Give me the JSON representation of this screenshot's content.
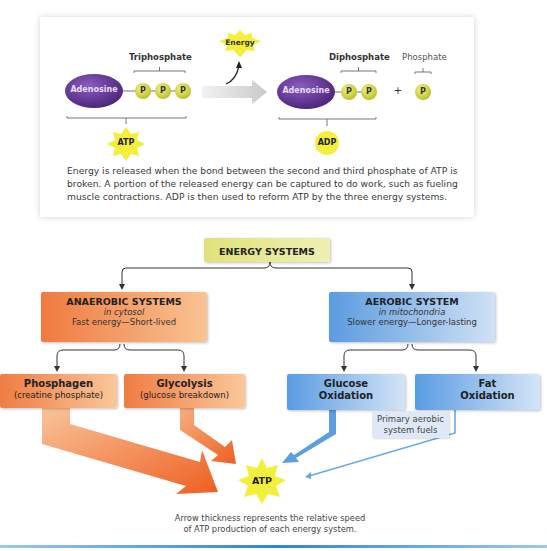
{
  "atp_panel": {
    "energy_label": "Energy",
    "left": {
      "group_label": "Triphosphate",
      "molecule": "Adenosine",
      "phosphates": [
        "P",
        "P",
        "P"
      ],
      "badge": "ATP"
    },
    "right": {
      "group_label": "Diphosphate",
      "free_label": "Phosphate",
      "molecule": "Adenosine",
      "phosphates": [
        "P",
        "P"
      ],
      "plus": "+",
      "free_phosphate": "P",
      "badge": "ADP"
    },
    "caption": "Energy is released when the bond between the second and third phosphate of ATP is broken. A portion of the released energy can be captured to do work, such as fueling muscle contractions. ADP is then used to reform ATP by the three energy systems."
  },
  "energy_systems": {
    "root": "ENERGY SYSTEMS",
    "anaerobic": {
      "title": "ANAEROBIC SYSTEMS",
      "location": "in cytosol",
      "summary": "Fast energy—Short-lived",
      "children": [
        {
          "title": "Phosphagen",
          "subtitle": "(creatine phosphate)"
        },
        {
          "title": "Glycolysis",
          "subtitle": "(glucose breakdown)"
        }
      ]
    },
    "aerobic": {
      "title": "AEROBIC SYSTEM",
      "location": "in mitochondria",
      "summary": "Slower energy—Longer-lasting",
      "children": [
        {
          "title": "Glucose Oxidation"
        },
        {
          "title": "Fat Oxidation"
        }
      ],
      "fuel_note": "Primary aerobic system fuels"
    },
    "output_badge": "ATP",
    "footnote_line1": "Arrow thickness represents the relative speed",
    "footnote_line2": "of ATP production of each energy system."
  },
  "colors": {
    "adenosine": "#5a2f8c",
    "phosphate": "#d4d63a",
    "burst": "#f4ef3a",
    "anaerobic": "#f07a40",
    "aerobic": "#5c9be0",
    "root_box": "#e4e68a",
    "bottom_rule": "#3b8fd0"
  }
}
